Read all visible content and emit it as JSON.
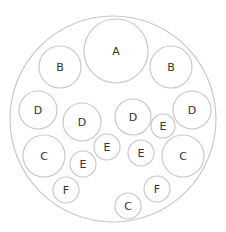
{
  "diagram": {
    "type": "circle-packing",
    "colors": {
      "stroke": "#c8c8c8",
      "text": "#333333",
      "background": "#ffffff"
    },
    "outer": {
      "cx": 113,
      "cy": 119,
      "r": 103
    },
    "circles": [
      {
        "label": "A",
        "cx": 116,
        "cy": 51,
        "r": 32
      },
      {
        "label": "B",
        "cx": 60,
        "cy": 67,
        "r": 21
      },
      {
        "label": "B",
        "cx": 171,
        "cy": 67,
        "r": 21
      },
      {
        "label": "D",
        "cx": 38,
        "cy": 110,
        "r": 19
      },
      {
        "label": "D",
        "cx": 82,
        "cy": 122,
        "r": 19
      },
      {
        "label": "D",
        "cx": 133,
        "cy": 117,
        "r": 18
      },
      {
        "label": "D",
        "cx": 192,
        "cy": 110,
        "r": 19
      },
      {
        "label": "E",
        "cx": 163,
        "cy": 126,
        "r": 12
      },
      {
        "label": "C",
        "cx": 44,
        "cy": 156,
        "r": 21
      },
      {
        "label": "E",
        "cx": 107,
        "cy": 147,
        "r": 13
      },
      {
        "label": "E",
        "cx": 83,
        "cy": 164,
        "r": 13
      },
      {
        "label": "E",
        "cx": 141,
        "cy": 153,
        "r": 13
      },
      {
        "label": "C",
        "cx": 183,
        "cy": 156,
        "r": 21
      },
      {
        "label": "F",
        "cx": 66,
        "cy": 190,
        "r": 13
      },
      {
        "label": "F",
        "cx": 157,
        "cy": 189,
        "r": 13
      },
      {
        "label": "C",
        "cx": 128,
        "cy": 206,
        "r": 13
      }
    ]
  }
}
